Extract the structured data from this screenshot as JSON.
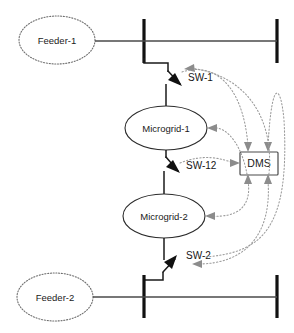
{
  "diagram": {
    "colors": {
      "busbar": "#111111",
      "power_line": "#1a1a1a",
      "feeder_line": "#4a4a4a",
      "comm_line": "#9a9a9a",
      "dms_border": "#4a4a4a",
      "feeder_border": "#6e6e6e",
      "microgrid_border": "#2b2b2b",
      "background": "#ffffff",
      "text": "#1a1a1a"
    },
    "feeders": [
      {
        "id": "feeder-1",
        "label": "Feeder-1"
      },
      {
        "id": "feeder-2",
        "label": "Feeder-2"
      }
    ],
    "microgrids": [
      {
        "id": "microgrid-1",
        "label": "Microgrid-1"
      },
      {
        "id": "microgrid-2",
        "label": "Microgrid-2"
      }
    ],
    "switches": [
      {
        "id": "sw-1",
        "label": "SW-1"
      },
      {
        "id": "sw-12",
        "label": "SW-12"
      },
      {
        "id": "sw-2",
        "label": "SW-2"
      }
    ],
    "controller": {
      "id": "dms",
      "label": "DMS"
    }
  }
}
